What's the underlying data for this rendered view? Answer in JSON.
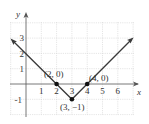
{
  "graph": {
    "function": "y = |x - 3| - 1",
    "axes": {
      "x_label": "x",
      "y_label": "y"
    },
    "x_ticks": [
      "1",
      "2",
      "3",
      "4",
      "5",
      "6"
    ],
    "y_ticks": [
      "3",
      "2",
      "1",
      "-1"
    ],
    "points": [
      {
        "label": "(2, 0)",
        "x": 2,
        "y": 0
      },
      {
        "label": "(3, −1)",
        "x": 3,
        "y": -1
      },
      {
        "label": "(4, 0)",
        "x": 4,
        "y": 0
      }
    ],
    "colors": {
      "line": "#3a3a3a",
      "grid": "#d0d0d0",
      "axis": "#555555"
    }
  }
}
